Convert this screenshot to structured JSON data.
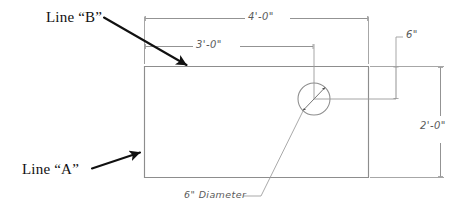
{
  "drawing": {
    "title": "Rectangular plate layout with 6 inch diameter hole",
    "colors": {
      "background": "#ffffff",
      "object_line": "#8a8a8a",
      "dimension_line": "#9a9a9a",
      "callout_arrow": "#111111",
      "callout_text": "#111111",
      "dimension_text": "#5a5a5a"
    },
    "callouts": [
      {
        "id": "line-b",
        "label": "Line “B”",
        "points_to": "top-edge-of-plate"
      },
      {
        "id": "line-a",
        "label": "Line “A”",
        "points_to": "left-edge-of-plate"
      }
    ],
    "dimensions": [
      {
        "id": "overall-width",
        "label": "4'-0\"",
        "orientation": "horizontal",
        "position": "top",
        "value_feet": 4,
        "value_inches": 0
      },
      {
        "id": "hole-center-offset",
        "label": "3'-0\"",
        "orientation": "horizontal",
        "position": "top-inner",
        "value_feet": 3,
        "value_inches": 0
      },
      {
        "id": "hole-vertical-offset",
        "label": "6\"",
        "orientation": "vertical",
        "position": "right-upper",
        "value_feet": 0,
        "value_inches": 6
      },
      {
        "id": "overall-height",
        "label": "2'-0\"",
        "orientation": "vertical",
        "position": "right",
        "value_feet": 2,
        "value_inches": 0
      }
    ],
    "features": [
      {
        "id": "hole",
        "label": "6\" Diameter",
        "shape": "circle",
        "diameter_inches": 6
      }
    ]
  }
}
